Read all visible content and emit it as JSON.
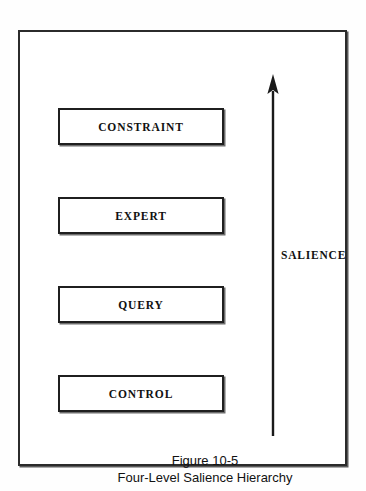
{
  "figure": {
    "frame": {
      "border_color": "#2b2b2b"
    },
    "levels": [
      {
        "label": "CONSTRAINT"
      },
      {
        "label": "EXPERT"
      },
      {
        "label": "QUERY"
      },
      {
        "label": "CONTROL"
      }
    ],
    "axis": {
      "label": "SALIENCE",
      "direction": "up",
      "icon": "up-arrow-icon",
      "color": "#1a1a1a"
    },
    "caption": {
      "line1": "Figure 10-5",
      "line2": "Four-Level Salience Hierarchy"
    }
  }
}
